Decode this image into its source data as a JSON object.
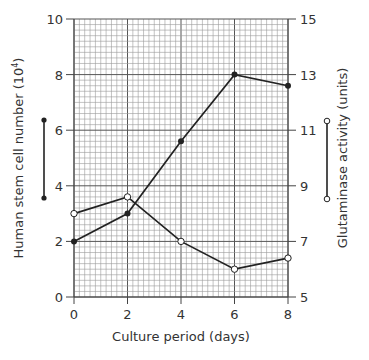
{
  "chart_data": {
    "type": "line",
    "title": "",
    "xlabel": "Culture period (days)",
    "ylabel": "Human stem cell number (10^4)",
    "ylabel_base": "Human stem cell number (10",
    "ylabel_exp": "4",
    "ylabel_close": ")",
    "y2label": "Glutaminase activity (units)",
    "x": [
      0,
      2,
      4,
      6,
      8
    ],
    "xlim": [
      0,
      8
    ],
    "ylim": [
      0,
      10
    ],
    "y2lim": [
      5,
      15
    ],
    "x_ticks": [
      "0",
      "2",
      "4",
      "6",
      "8"
    ],
    "y_ticks": [
      "0",
      "2",
      "4",
      "6",
      "8",
      "10"
    ],
    "y2_ticks": [
      "5",
      "7",
      "9",
      "11",
      "13",
      "15"
    ],
    "grid": true,
    "series": [
      {
        "name": "Human stem cell number",
        "axis": "left",
        "marker": "filled-circle",
        "values": [
          2.0,
          3.0,
          5.6,
          8.0,
          7.6
        ]
      },
      {
        "name": "Glutaminase activity",
        "axis": "right",
        "marker": "open-circle",
        "values": [
          8.0,
          8.6,
          7.0,
          6.0,
          6.4
        ]
      }
    ],
    "legend": "markers beside each y-axis label"
  }
}
